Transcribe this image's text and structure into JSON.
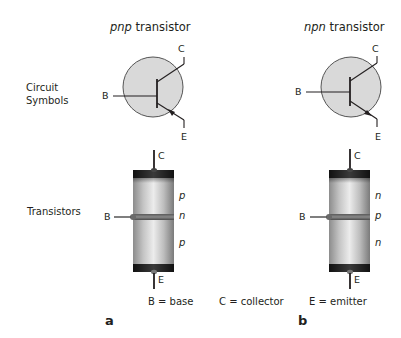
{
  "panels": [
    {
      "id": "a",
      "panel_label": "a",
      "title_italic": "pnp",
      "title_rest": " transistor",
      "symbol_pins": {
        "base": "B",
        "collector": "C",
        "emitter": "E"
      },
      "cylinder_pins": {
        "base": "B",
        "collector": "C",
        "emitter": "E"
      },
      "layers": [
        "p",
        "n",
        "p"
      ]
    },
    {
      "id": "b",
      "panel_label": "b",
      "title_italic": "npn",
      "title_rest": " transistor",
      "symbol_pins": {
        "base": "B",
        "collector": "C",
        "emitter": "E"
      },
      "cylinder_pins": {
        "base": "B",
        "collector": "C",
        "emitter": "E"
      },
      "layers": [
        "n",
        "p",
        "n"
      ]
    }
  ],
  "row_labels": {
    "circuit_symbols_line1": "Circuit",
    "circuit_symbols_line2": "Symbols",
    "transistors": "Transistors"
  },
  "legend": {
    "base": "B = base",
    "collector": "C = collector",
    "emitter": "E = emitter"
  },
  "colors": {
    "symbol_fill": "#d9d9d9",
    "line": "#231f20",
    "cap": "#1a1a1a"
  }
}
